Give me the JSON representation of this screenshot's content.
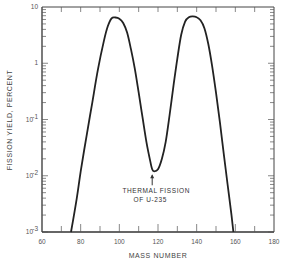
{
  "chart_data": {
    "type": "line",
    "title": "",
    "xlabel": "MASS NUMBER",
    "ylabel": "FISSION YIELD, PERCENT",
    "xlim": [
      60,
      180
    ],
    "ylim": [
      0.001,
      10
    ],
    "yscale": "log",
    "grid": false,
    "x_ticks": [
      "60",
      "80",
      "100",
      "120",
      "140",
      "160",
      "180"
    ],
    "y_ticks": [
      {
        "value": 10,
        "label": "10"
      },
      {
        "value": 1,
        "label": "1"
      },
      {
        "value": 0.1,
        "label": "10",
        "exp": "-1"
      },
      {
        "value": 0.01,
        "label": "10",
        "exp": "-2"
      },
      {
        "value": 0.001,
        "label": "10",
        "exp": "-3"
      }
    ],
    "series": [
      {
        "name": "Thermal fission of U-235",
        "x": [
          75,
          78,
          80,
          83,
          86,
          89,
          92,
          94,
          96,
          98,
          100,
          102,
          104,
          106,
          108,
          110,
          112,
          114,
          116,
          117,
          118,
          120,
          122,
          124,
          126,
          128,
          130,
          132,
          134,
          136,
          138,
          140,
          142,
          144,
          146,
          148,
          150,
          152,
          154,
          156,
          158,
          159
        ],
        "y": [
          0.001,
          0.004,
          0.012,
          0.05,
          0.2,
          0.8,
          2.5,
          4.5,
          6.3,
          6.5,
          6.2,
          5.2,
          3.5,
          1.8,
          0.8,
          0.3,
          0.11,
          0.04,
          0.018,
          0.013,
          0.012,
          0.013,
          0.02,
          0.04,
          0.12,
          0.4,
          1.2,
          3.2,
          5.5,
          6.6,
          6.8,
          6.6,
          5.8,
          4.2,
          2.2,
          0.9,
          0.3,
          0.09,
          0.025,
          0.007,
          0.002,
          0.001
        ]
      }
    ],
    "annotations": [
      {
        "text_line1": "THERMAL FISSION",
        "text_line2": "OF U-235",
        "x": 117,
        "y": 0.012,
        "arrow": true
      }
    ]
  }
}
